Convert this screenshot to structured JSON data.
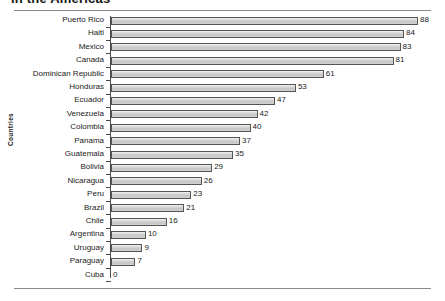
{
  "title": "in the Americas",
  "chart_data": {
    "type": "bar",
    "orientation": "horizontal",
    "title": "in the Americas",
    "xlabel": "",
    "ylabel": "Countries",
    "grid": false,
    "legend": null,
    "xlim": [
      0,
      88
    ],
    "categories": [
      "Puerto Rico",
      "Haiti",
      "Mexico",
      "Canada",
      "Dominican Republic",
      "Honduras",
      "Ecuador",
      "Venezuela",
      "Colombia",
      "Panama",
      "Guatemala",
      "Bolivia",
      "Nicaragua",
      "Peru",
      "Brazil",
      "Chile",
      "Argentina",
      "Uruguay",
      "Paraguay",
      "Cuba"
    ],
    "values": [
      88,
      84,
      83,
      81,
      61,
      53,
      47,
      42,
      40,
      37,
      35,
      29,
      26,
      23,
      21,
      16,
      10,
      9,
      7,
      0
    ],
    "data_labels": [
      "88",
      "84",
      "83",
      "81",
      "61",
      "53",
      "47",
      "42",
      "40",
      "37",
      "35",
      "29",
      "26",
      "23",
      "21",
      "16",
      "10",
      "9",
      "7",
      "0"
    ],
    "bar_fill": "#d2d2d2",
    "bar_border": "#555555"
  }
}
